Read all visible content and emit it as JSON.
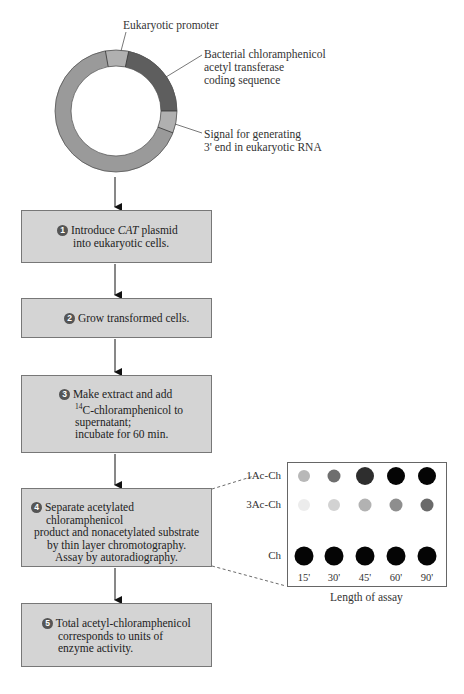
{
  "plasmid": {
    "labels": {
      "promoter": "Eukaryotic promoter",
      "cat_coding": [
        "Bacterial chloramphenicol",
        "acetyl transferase",
        "coding sequence"
      ],
      "signal": [
        "Signal for generating",
        "3' end in eukaryotic RNA"
      ]
    },
    "colors": {
      "backbone": "#9a9a9a",
      "promoter": "#b0b0b0",
      "cat": "#5e5e5e",
      "signal": "#b0b0b0"
    }
  },
  "steps": [
    {
      "number": "1",
      "lines": [
        "Introduce",
        "CAT",
        "plasmid",
        "into eukaryotic cells."
      ]
    },
    {
      "number": "2",
      "lines": [
        "Grow transformed cells."
      ]
    },
    {
      "number": "3",
      "lines": [
        "Make extract and add",
        "14",
        "C-chloramphenicol to",
        "supernatant;",
        "incubate for 60 min."
      ]
    },
    {
      "number": "4",
      "lines": [
        "Separate acetylated chloramphenicol",
        "product and nonacetylated substrate",
        "by thin layer chromotography.",
        "Assay by autoradiography."
      ]
    },
    {
      "number": "5",
      "lines": [
        "Total acetyl-chloramphenicol",
        "corresponds to units of",
        "enzyme activity."
      ]
    }
  ],
  "tlc": {
    "row_labels": [
      "1Ac-Ch",
      "3Ac-Ch",
      "Ch"
    ],
    "time_labels": [
      "15'",
      "30'",
      "45'",
      "60'",
      "90'"
    ],
    "x_axis_label": "Length of assay",
    "spots": {
      "1Ac-Ch": [
        {
          "r": 6,
          "color": "#b8b8b8"
        },
        {
          "r": 6.5,
          "color": "#6e6e6e"
        },
        {
          "r": 9,
          "color": "#2e2e2e"
        },
        {
          "r": 9,
          "color": "#050505"
        },
        {
          "r": 9,
          "color": "#050505"
        }
      ],
      "3Ac-Ch": [
        {
          "r": 6,
          "color": "#ececec"
        },
        {
          "r": 6,
          "color": "#d2d2d2"
        },
        {
          "r": 6.5,
          "color": "#b2b2b2"
        },
        {
          "r": 6.5,
          "color": "#8e8e8e"
        },
        {
          "r": 6.5,
          "color": "#6a6a6a"
        }
      ],
      "Ch": [
        {
          "r": 9.5,
          "color": "#050505"
        },
        {
          "r": 9.5,
          "color": "#050505"
        },
        {
          "r": 9.5,
          "color": "#050505"
        },
        {
          "r": 9.5,
          "color": "#050505"
        },
        {
          "r": 9.5,
          "color": "#050505"
        }
      ]
    }
  }
}
